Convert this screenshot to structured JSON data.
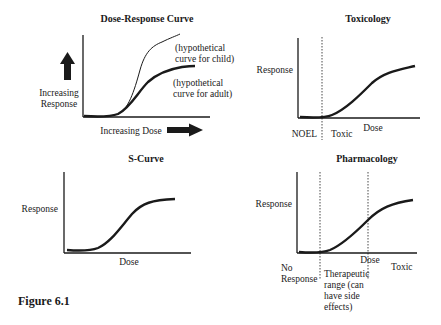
{
  "figure_label": "Figure 6.1",
  "panels": {
    "dose_response": {
      "title": "Dose-Response Curve",
      "y_label_1": "Increasing",
      "y_label_2": "Response",
      "x_label": "Increasing Dose",
      "child_label_1": "(hypothetical",
      "child_label_2": "curve for child)",
      "adult_label_1": "(hypothetical",
      "adult_label_2": "curve for adult)"
    },
    "toxicology": {
      "title": "Toxicology",
      "y_label": "Response",
      "x_label": "Dose",
      "threshold_label": "NOEL",
      "region_label": "Toxic"
    },
    "s_curve": {
      "title": "S-Curve",
      "y_label": "Response",
      "x_label": "Dose"
    },
    "pharmacology": {
      "title": "Pharmacology",
      "y_label": "Response",
      "x_label": "Dose",
      "region_1_a": "No",
      "region_1_b": "Response",
      "region_2_a": "Therapeutic",
      "region_2_b": "range (can",
      "region_2_c": "have side",
      "region_2_d": "effects)",
      "region_3": "Toxic"
    }
  },
  "colors": {
    "ink": "#1a1a1a",
    "background": "#ffffff"
  }
}
